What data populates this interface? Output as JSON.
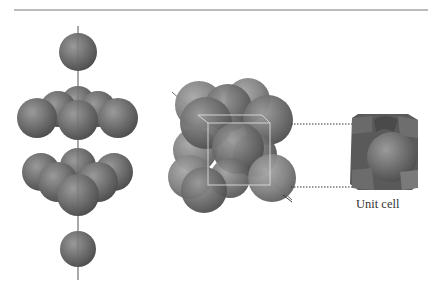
{
  "figure": {
    "top_rule": true,
    "panels": [
      {
        "name": "stacked-layers",
        "description": "Close-packed layers stacked along vertical axis (ABC stacking)"
      },
      {
        "name": "fcc-cluster",
        "description": "Cluster of 14 spheres with cubic cell outline"
      },
      {
        "name": "unit-cell",
        "description": "Truncated spheres forming unit cube"
      }
    ],
    "unit_cell_label": "Unit cell",
    "colors": {
      "sphere": "#6e6e6e",
      "sphere_highlight": "#a0a0a0",
      "sphere_dark": "#4a4a4a",
      "axis": "#555555",
      "rule": "#777777",
      "cube_edge": "#d8d8d8"
    }
  }
}
